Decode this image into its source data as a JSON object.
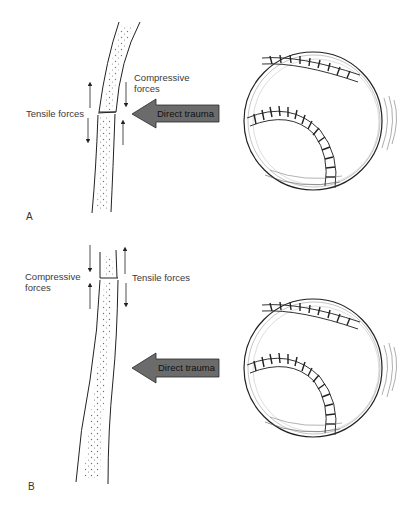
{
  "panels": [
    {
      "letter": "A",
      "left_label": "Tensile forces",
      "right_label_line1": "Compressive",
      "right_label_line2": "forces",
      "trauma_label": "Direct trauma",
      "bone": "curved-bone-fracture",
      "object": "baseball"
    },
    {
      "letter": "B",
      "left_label_line1": "Compressive",
      "left_label_line2": "forces",
      "right_label": "Tensile forces",
      "trauma_label": "Direct trauma",
      "bone": "straight-bone-fracture",
      "object": "baseball"
    }
  ],
  "colors": {
    "arrow_fill": "#6b6b6b",
    "arrow_stroke": "#2a2a2a",
    "line": "#222222",
    "background": "#ffffff"
  }
}
